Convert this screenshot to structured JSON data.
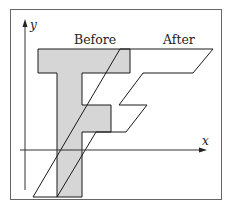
{
  "diagram": {
    "labels": {
      "before": "Before",
      "after": "After",
      "x_axis": "x",
      "y_axis": "y"
    },
    "colors": {
      "before_fill": "#d6d6d6",
      "outline": "#1a1a1a",
      "frame": "#555555",
      "axis": "#333333",
      "background": "#ffffff"
    },
    "before_shape": {
      "name": "F (original)",
      "fill": "gray",
      "points": "38,49 130,49 130,73 82,73 82,105 111,105 111,132 82,132 82,197 57,197 57,73 38,73"
    },
    "after_shape": {
      "name": "F (sheared)",
      "fill": "none",
      "points": "120,49 213,49 193,73 143,73 119,105 147,105 126,132 96,132 57,197 33,197"
    }
  }
}
